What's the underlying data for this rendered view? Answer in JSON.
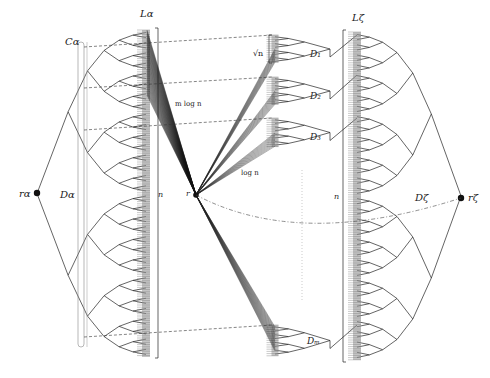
{
  "labels": {
    "L_alpha": "Lα",
    "C_alpha": "Cα",
    "D_alpha": "Dα",
    "r_alpha": "rα",
    "n_left": "n",
    "m_log_n": "m log n",
    "r": "r",
    "log_n": "log n",
    "sqrt_n": "√n",
    "D1": "D₁",
    "D2": "D₂",
    "D3": "D₃",
    "Dm": "Dₘ",
    "L_zeta": "Lζ",
    "n_right": "n",
    "D_zeta": "Dζ",
    "r_zeta": "rζ"
  },
  "colors": {
    "line": "#222222",
    "shade": "#9a9a9a",
    "dashed": "#333333",
    "dotted": "#aaaaaa"
  },
  "nodes": {
    "r_alpha": {
      "x": 37,
      "y": 193
    },
    "r": {
      "x": 196,
      "y": 195
    },
    "r_zeta": {
      "x": 461,
      "y": 198
    }
  },
  "columns": {
    "L_alpha": {
      "x": 146,
      "top": 30,
      "bottom": 357
    },
    "L_zeta": {
      "x": 357,
      "top": 32,
      "bottom": 360
    },
    "D_blocks": [
      {
        "x": 275,
        "top": 35,
        "bottom": 63
      },
      {
        "x": 275,
        "top": 77,
        "bottom": 105
      },
      {
        "x": 275,
        "top": 118,
        "bottom": 147
      },
      {
        "x": 275,
        "top": 325,
        "bottom": 356
      }
    ]
  }
}
